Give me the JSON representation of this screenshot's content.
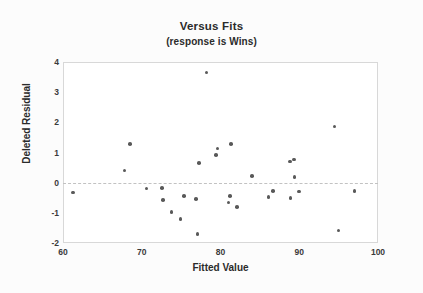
{
  "chart_data": {
    "type": "scatter",
    "title": "Versus Fits",
    "subtitle": "(response is Wins)",
    "xlabel": "Fitted Value",
    "ylabel": "Deleted Residual",
    "xlim": [
      60,
      100
    ],
    "ylim": [
      -2,
      4
    ],
    "xticks": [
      60,
      70,
      80,
      90,
      100
    ],
    "yticks": [
      -2,
      -1,
      0,
      1,
      2,
      3,
      4
    ],
    "grid": false,
    "legend": null,
    "reference_lines": [
      {
        "axis": "y",
        "value": 0,
        "style": "dashed",
        "color": "#c2c2c2"
      }
    ],
    "marker": {
      "shape": "circle",
      "color": "#595959",
      "size": 3.6
    },
    "points": [
      {
        "x": 61.3,
        "y": -0.32
      },
      {
        "x": 67.8,
        "y": 0.4
      },
      {
        "x": 68.5,
        "y": 1.28
      },
      {
        "x": 70.6,
        "y": -0.19
      },
      {
        "x": 72.6,
        "y": -0.18
      },
      {
        "x": 72.7,
        "y": -0.57
      },
      {
        "x": 73.8,
        "y": -0.97
      },
      {
        "x": 74.9,
        "y": -1.21
      },
      {
        "x": 75.4,
        "y": -0.45
      },
      {
        "x": 76.9,
        "y": -0.55
      },
      {
        "x": 77.1,
        "y": -1.7
      },
      {
        "x": 77.3,
        "y": 0.66
      },
      {
        "x": 78.2,
        "y": 3.65
      },
      {
        "x": 79.4,
        "y": 0.92
      },
      {
        "x": 79.6,
        "y": 1.13
      },
      {
        "x": 81.3,
        "y": 1.29
      },
      {
        "x": 81.2,
        "y": -0.45
      },
      {
        "x": 81.0,
        "y": -0.66
      },
      {
        "x": 82.1,
        "y": -0.81
      },
      {
        "x": 84.0,
        "y": 0.23
      },
      {
        "x": 86.1,
        "y": -0.47
      },
      {
        "x": 86.7,
        "y": -0.28
      },
      {
        "x": 88.8,
        "y": 0.7
      },
      {
        "x": 89.3,
        "y": 0.77
      },
      {
        "x": 89.4,
        "y": 0.19
      },
      {
        "x": 88.9,
        "y": -0.5
      },
      {
        "x": 90.0,
        "y": -0.29
      },
      {
        "x": 94.5,
        "y": 1.86
      },
      {
        "x": 95.0,
        "y": -1.58
      },
      {
        "x": 97.0,
        "y": -0.28
      }
    ]
  }
}
